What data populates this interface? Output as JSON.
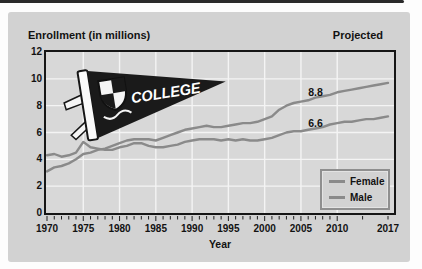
{
  "panel": {
    "title_left": "Enrollment (in millions)",
    "title_right": "Projected",
    "background": "#d2d2d2"
  },
  "pennant": {
    "text": "COLLEGE"
  },
  "colors": {
    "plot_background": "#d8d8d8",
    "gridline": "#f4f4f4",
    "axis_border": "#161616",
    "text": "#121212",
    "line_gray": "#8a8a8a",
    "top_rule": "#2a2a2a"
  },
  "chart_data": {
    "type": "line",
    "title": "Enrollment (in millions)",
    "subtitle": "Projected",
    "xlabel": "Year",
    "ylabel": "Enrollment (in millions)",
    "ylim": [
      0,
      12
    ],
    "yticks": [
      0,
      2,
      4,
      6,
      8,
      10,
      12
    ],
    "ygrid": [
      2,
      4,
      6,
      8,
      10
    ],
    "xticks": [
      1970,
      1975,
      1980,
      1985,
      1990,
      1995,
      2000,
      2005,
      2010,
      2017
    ],
    "xgrid": [
      1975,
      1980,
      1985,
      1990,
      1995,
      2000,
      2005,
      2010
    ],
    "minor_ticks": {
      "from": 1970,
      "to": 2010,
      "step": 1,
      "extra": [
        2013.5,
        2017
      ]
    },
    "grid": "white major gridlines on gray plot",
    "legend_position": "lower right",
    "x": [
      1970,
      1971,
      1972,
      1973,
      1974,
      1975,
      1976,
      1977,
      1978,
      1979,
      1980,
      1981,
      1982,
      1983,
      1984,
      1985,
      1986,
      1987,
      1988,
      1989,
      1990,
      1991,
      1992,
      1993,
      1994,
      1995,
      1996,
      1997,
      1998,
      1999,
      2000,
      2001,
      2002,
      2003,
      2004,
      2005,
      2006,
      2007,
      2008,
      2009,
      2010,
      2011,
      2012,
      2013,
      2014,
      2015,
      2016,
      2017
    ],
    "series": [
      {
        "name": "Female",
        "color": "#8a8a8a",
        "values": [
          3.1,
          3.4,
          3.5,
          3.7,
          4.0,
          4.4,
          4.5,
          4.7,
          4.8,
          5.0,
          5.2,
          5.4,
          5.5,
          5.5,
          5.5,
          5.4,
          5.6,
          5.8,
          6.0,
          6.2,
          6.3,
          6.4,
          6.5,
          6.4,
          6.4,
          6.5,
          6.6,
          6.7,
          6.7,
          6.8,
          7.0,
          7.2,
          7.7,
          8.0,
          8.2,
          8.3,
          8.4,
          8.6,
          8.7,
          8.8,
          9.0,
          9.1,
          9.2,
          9.3,
          9.4,
          9.5,
          9.6,
          9.7
        ]
      },
      {
        "name": "Male",
        "color": "#8a8a8a",
        "values": [
          4.3,
          4.4,
          4.2,
          4.3,
          4.5,
          5.3,
          4.9,
          4.8,
          4.7,
          4.7,
          4.9,
          5.0,
          5.2,
          5.2,
          5.0,
          4.9,
          4.9,
          5.0,
          5.1,
          5.3,
          5.4,
          5.5,
          5.5,
          5.5,
          5.4,
          5.5,
          5.4,
          5.5,
          5.4,
          5.4,
          5.5,
          5.6,
          5.8,
          6.0,
          6.1,
          6.1,
          6.2,
          6.3,
          6.4,
          6.6,
          6.7,
          6.8,
          6.8,
          6.9,
          7.0,
          7.0,
          7.1,
          7.2
        ]
      }
    ],
    "annotations": [
      {
        "text": "8.8",
        "series": "Female",
        "anchor_year": 2007,
        "anchor_value": 9.05
      },
      {
        "text": "6.6",
        "series": "Male",
        "anchor_year": 2007,
        "anchor_value": 6.7
      }
    ]
  }
}
